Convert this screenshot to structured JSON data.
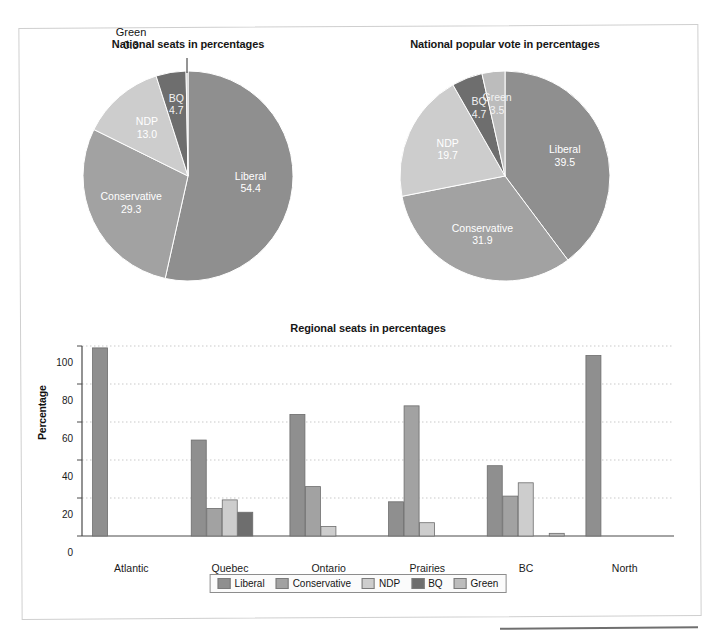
{
  "colors": {
    "liberal": "#8f8f8f",
    "conservative": "#a2a2a2",
    "ndp": "#cdcdcd",
    "bq": "#6e6e6e",
    "green": "#bcbcbc",
    "gridline": "#c9c9c9",
    "axis": "#4a4a4a",
    "frame": "#cfcfcf"
  },
  "parties": [
    "Liberal",
    "Conservative",
    "NDP",
    "BQ",
    "Green"
  ],
  "pie_seats": {
    "title": "National seats in percentages",
    "chart_data": {
      "type": "pie",
      "title": "National seats in percentages",
      "labels": [
        "Liberal",
        "Conservative",
        "NDP",
        "BQ",
        "Green"
      ],
      "values": [
        54.4,
        29.3,
        13.0,
        4.7,
        0.3
      ],
      "value_labels": [
        "54.4",
        "29.3",
        "13.0",
        "4.7",
        "0.3"
      ],
      "units": "percent",
      "legend": "inside-slice labels with callout for small slices"
    }
  },
  "pie_vote": {
    "title": "National popular vote in percentages",
    "chart_data": {
      "type": "pie",
      "title": "National popular vote in percentages",
      "labels": [
        "Liberal",
        "Conservative",
        "NDP",
        "BQ",
        "Green"
      ],
      "values": [
        39.5,
        31.9,
        19.7,
        4.7,
        3.5
      ],
      "value_labels": [
        "39.5",
        "31.9",
        "19.7",
        "4.7",
        "3.5"
      ],
      "units": "percent",
      "legend": "inside-slice labels with callout for small slices"
    }
  },
  "bar": {
    "title": "Regional seats in percentages",
    "xlabel": "Region",
    "ylabel": "Percentage",
    "ytick_labels": [
      "0",
      "20",
      "40",
      "60",
      "80",
      "100"
    ],
    "legend_labels": [
      "Liberal",
      "Conservative",
      "NDP",
      "BQ",
      "Green"
    ],
    "chart_data": {
      "type": "bar",
      "title": "Regional seats in percentages",
      "xlabel": "Region",
      "ylabel": "Percentage",
      "ylim": [
        0,
        100
      ],
      "yticks": [
        0,
        20,
        40,
        60,
        80,
        100
      ],
      "grid": true,
      "legend_position": "bottom",
      "categories": [
        "Atlantic",
        "Quebec",
        "Ontario",
        "Prairies",
        "BC",
        "North"
      ],
      "series": [
        {
          "name": "Liberal",
          "values": [
            99.0,
            50.5,
            64.0,
            18.0,
            37.0,
            95.0
          ]
        },
        {
          "name": "Conservative",
          "values": [
            0,
            14.5,
            26.0,
            68.5,
            21.0,
            0
          ]
        },
        {
          "name": "NDP",
          "values": [
            0,
            19.0,
            5.0,
            7.0,
            28.0,
            0
          ]
        },
        {
          "name": "BQ",
          "values": [
            0,
            12.5,
            0,
            0,
            0,
            0
          ]
        },
        {
          "name": "Green",
          "values": [
            0,
            0,
            0,
            0,
            1.4,
            0
          ]
        }
      ]
    }
  }
}
